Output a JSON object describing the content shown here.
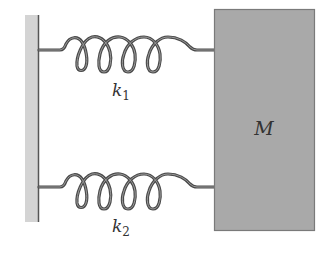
{
  "diagram": {
    "wall": {
      "fill": "#d4d4d4",
      "edge": "#555555"
    },
    "springs": [
      {
        "id": "spring-1",
        "label": "k",
        "subscript": "1",
        "y": 50
      },
      {
        "id": "spring-2",
        "label": "k",
        "subscript": "2",
        "y": 187
      }
    ],
    "mass": {
      "label": "M",
      "fill": "#a9a9a9",
      "stroke": "#7a7a7a"
    },
    "colors": {
      "spring": "#4a4a4a",
      "spring_inner": "#9a9a9a"
    }
  }
}
